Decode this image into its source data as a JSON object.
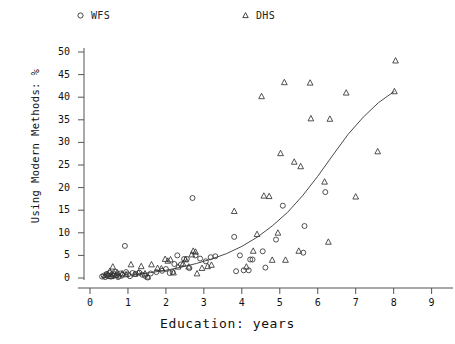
{
  "chart_data": {
    "type": "scatter",
    "title": "",
    "xlabel": "Education: years",
    "ylabel": "Using Modern Methods: %",
    "xlim": [
      0,
      9.3
    ],
    "ylim": [
      0,
      52
    ],
    "xticks": [
      "0",
      "1",
      "2",
      "3",
      "4",
      "5",
      "6",
      "7",
      "8",
      "9"
    ],
    "yticks": [
      "0",
      "5",
      "10",
      "15",
      "20",
      "25",
      "30",
      "35",
      "40",
      "45",
      "50"
    ],
    "grid": false,
    "legend_position": "top",
    "legend": [
      {
        "name": "WFS",
        "marker": "circle"
      },
      {
        "name": "DHS",
        "marker": "triangle"
      }
    ],
    "series": [
      {
        "name": "WFS",
        "marker": "circle",
        "points": [
          [
            0.32,
            0.3
          ],
          [
            0.36,
            0.5
          ],
          [
            0.4,
            0.2
          ],
          [
            0.44,
            0.9
          ],
          [
            0.48,
            0.4
          ],
          [
            0.52,
            1.1
          ],
          [
            0.55,
            0.3
          ],
          [
            0.58,
            0.8
          ],
          [
            0.62,
            0.5
          ],
          [
            0.66,
            1.4
          ],
          [
            0.7,
            0.6
          ],
          [
            0.74,
            0.2
          ],
          [
            0.8,
            1.0
          ],
          [
            0.86,
            0.7
          ],
          [
            0.92,
            7.1
          ],
          [
            0.95,
            1.3
          ],
          [
            1.0,
            0.8
          ],
          [
            1.05,
            0.4
          ],
          [
            1.12,
            1.1
          ],
          [
            1.2,
            0.9
          ],
          [
            1.3,
            1.2
          ],
          [
            1.38,
            0.7
          ],
          [
            1.45,
            0.5
          ],
          [
            1.52,
            0.1
          ],
          [
            1.6,
            1.0
          ],
          [
            1.75,
            1.3
          ],
          [
            1.9,
            1.6
          ],
          [
            2.0,
            2.0
          ],
          [
            2.1,
            1.1
          ],
          [
            2.18,
            1.3
          ],
          [
            2.22,
            3.1
          ],
          [
            2.3,
            5.0
          ],
          [
            2.4,
            3.0
          ],
          [
            2.48,
            4.2
          ],
          [
            2.55,
            4.2
          ],
          [
            2.62,
            2.2
          ],
          [
            2.7,
            17.7
          ],
          [
            2.78,
            5.0
          ],
          [
            2.9,
            4.3
          ],
          [
            3.05,
            3.7
          ],
          [
            3.18,
            4.6
          ],
          [
            3.3,
            4.8
          ],
          [
            3.8,
            9.1
          ],
          [
            3.85,
            1.5
          ],
          [
            3.95,
            5.0
          ],
          [
            4.05,
            1.7
          ],
          [
            4.18,
            1.7
          ],
          [
            4.22,
            4.1
          ],
          [
            4.28,
            4.1
          ],
          [
            4.55,
            5.9
          ],
          [
            4.62,
            2.3
          ],
          [
            4.9,
            8.5
          ],
          [
            5.08,
            16.0
          ],
          [
            5.62,
            5.6
          ],
          [
            5.65,
            11.5
          ],
          [
            6.2,
            19.0
          ]
        ]
      },
      {
        "name": "DHS",
        "marker": "triangle",
        "points": [
          [
            0.4,
            0.6
          ],
          [
            0.46,
            0.9
          ],
          [
            0.52,
            1.5
          ],
          [
            0.56,
            0.4
          ],
          [
            0.6,
            2.5
          ],
          [
            0.64,
            1.0
          ],
          [
            0.68,
            0.7
          ],
          [
            0.72,
            1.2
          ],
          [
            0.78,
            0.5
          ],
          [
            0.85,
            1.0
          ],
          [
            0.95,
            0.8
          ],
          [
            1.08,
            3.0
          ],
          [
            1.18,
            0.9
          ],
          [
            1.28,
            1.2
          ],
          [
            1.35,
            2.6
          ],
          [
            1.45,
            1.0
          ],
          [
            1.52,
            0.3
          ],
          [
            1.62,
            3.0
          ],
          [
            1.78,
            2.2
          ],
          [
            1.88,
            2.1
          ],
          [
            1.98,
            4.2
          ],
          [
            2.05,
            3.8
          ],
          [
            2.12,
            4.1
          ],
          [
            2.2,
            1.2
          ],
          [
            2.32,
            2.5
          ],
          [
            2.45,
            3.2
          ],
          [
            2.52,
            4.1
          ],
          [
            2.6,
            2.5
          ],
          [
            2.68,
            5.2
          ],
          [
            2.72,
            6.0
          ],
          [
            2.78,
            5.8
          ],
          [
            2.82,
            1.0
          ],
          [
            2.95,
            2.2
          ],
          [
            3.1,
            2.6
          ],
          [
            3.2,
            2.9
          ],
          [
            3.8,
            14.8
          ],
          [
            4.12,
            2.5
          ],
          [
            4.3,
            6.0
          ],
          [
            4.4,
            9.7
          ],
          [
            4.52,
            40.2
          ],
          [
            4.58,
            18.2
          ],
          [
            4.72,
            18.1
          ],
          [
            4.8,
            4.0
          ],
          [
            4.95,
            10.0
          ],
          [
            5.02,
            27.6
          ],
          [
            5.12,
            43.3
          ],
          [
            5.15,
            4.0
          ],
          [
            5.38,
            25.7
          ],
          [
            5.5,
            6.0
          ],
          [
            5.55,
            24.7
          ],
          [
            5.8,
            43.2
          ],
          [
            5.82,
            35.3
          ],
          [
            6.18,
            21.3
          ],
          [
            6.28,
            8.0
          ],
          [
            6.32,
            35.2
          ],
          [
            6.75,
            41.0
          ],
          [
            7.0,
            18.0
          ],
          [
            7.58,
            28.0
          ],
          [
            8.02,
            41.3
          ],
          [
            8.05,
            48.1
          ]
        ]
      }
    ],
    "fit_curve": {
      "description": "fitted exponential trend line",
      "points": [
        [
          1.15,
          0.8
        ],
        [
          1.6,
          1.2
        ],
        [
          2.0,
          1.7
        ],
        [
          2.4,
          2.4
        ],
        [
          2.8,
          3.2
        ],
        [
          3.2,
          4.2
        ],
        [
          3.6,
          5.4
        ],
        [
          4.0,
          7.0
        ],
        [
          4.4,
          9.0
        ],
        [
          4.8,
          11.5
        ],
        [
          5.2,
          14.5
        ],
        [
          5.6,
          18.2
        ],
        [
          6.0,
          22.5
        ],
        [
          6.4,
          27.2
        ],
        [
          6.8,
          31.8
        ],
        [
          7.2,
          35.6
        ],
        [
          7.6,
          38.8
        ],
        [
          8.02,
          41.3
        ]
      ]
    }
  }
}
